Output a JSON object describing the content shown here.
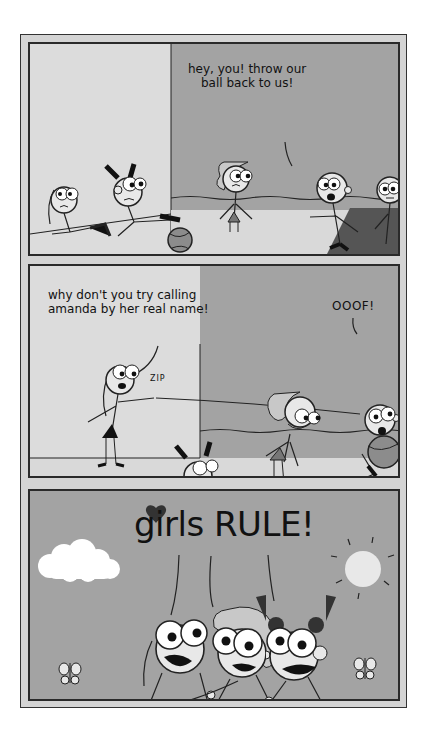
{
  "comic": {
    "panels": [
      {
        "id": 1,
        "speech": "hey, you! throw our\nball back to us!",
        "speaker": "boy-with-mouth-open"
      },
      {
        "id": 2,
        "speech": "why don't you try calling\namanda by her real name!",
        "exclamation": "OOOF!",
        "sound_effect": "ZIP"
      },
      {
        "id": 3,
        "speech": "girls RULE!",
        "decorations": [
          "heart-icon",
          "cloud-icon",
          "sun-icon",
          "butterfly-icon",
          "butterfly-icon"
        ]
      }
    ]
  },
  "colors": {
    "frame": "#d4d4d4",
    "light_bg": "#dcdcdc",
    "mid_bg": "#a3a3a3",
    "ground": "#d9d9d9",
    "court": "#555555",
    "ink": "#111111"
  }
}
